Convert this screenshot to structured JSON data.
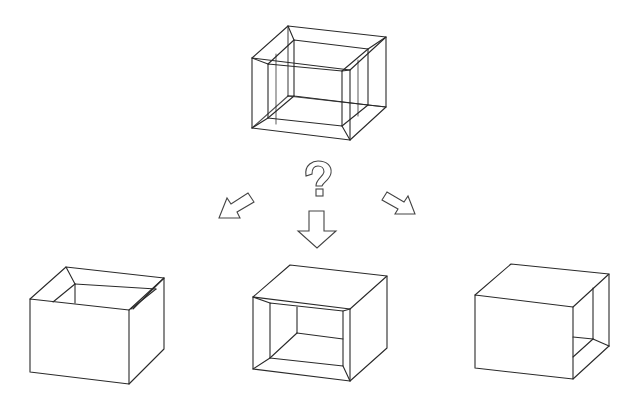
{
  "diagram": {
    "title": "Which view of the cube frame?",
    "question_symbol": "?",
    "colors": {
      "background": "#ffffff",
      "line": "#2a2a2a",
      "arrow_stroke": "#444444"
    },
    "source_figure": {
      "label": "Wireframe cube frame (hollow box with inner opening on all faces)"
    },
    "arrows": [
      {
        "label": "Option A direction",
        "direction": "down-left"
      },
      {
        "label": "Option B direction",
        "direction": "down"
      },
      {
        "label": "Option C direction",
        "direction": "down-right"
      }
    ],
    "options": [
      {
        "label": "Option A: box open at the top"
      },
      {
        "label": "Option B: box open at the front"
      },
      {
        "label": "Option C: box open on the right side"
      }
    ]
  }
}
